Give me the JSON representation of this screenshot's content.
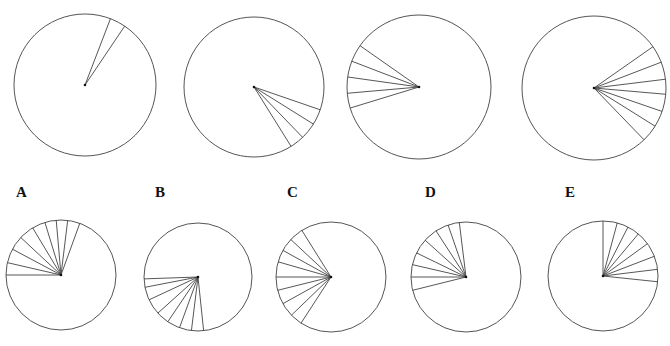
{
  "figure": {
    "stroke_color": "#555555",
    "top_row": [
      {
        "id": "top-1",
        "cx": 85,
        "cy": 85,
        "r": 71,
        "angles_deg_clockwise_from_top": [
          21,
          34
        ]
      },
      {
        "id": "top-2",
        "cx": 254,
        "cy": 87,
        "r": 70,
        "angles_deg_clockwise_from_top": [
          109,
          122,
          136,
          148
        ]
      },
      {
        "id": "top-3",
        "cx": 419,
        "cy": 87,
        "r": 72,
        "angles_deg_clockwise_from_top": [
          253,
          265,
          278,
          291,
          305
        ]
      },
      {
        "id": "top-4",
        "cx": 594,
        "cy": 88,
        "r": 72,
        "angles_deg_clockwise_from_top": [
          55,
          69,
          83,
          95,
          109,
          122,
          136
        ]
      }
    ],
    "options": [
      {
        "label": "A",
        "label_x": 16,
        "cx": 61,
        "cy": 275,
        "r": 55,
        "angles_deg_clockwise_from_top": [
          270,
          283,
          298,
          313,
          329,
          343,
          355,
          7,
          20
        ]
      },
      {
        "label": "B",
        "label_x": 155,
        "cx": 198,
        "cy": 277,
        "r": 54,
        "angles_deg_clockwise_from_top": [
          268,
          259,
          245,
          228,
          214,
          200,
          187,
          174
        ]
      },
      {
        "label": "C",
        "label_x": 287,
        "cx": 331,
        "cy": 277,
        "r": 55,
        "angles_deg_clockwise_from_top": [
          328,
          313,
          299,
          286,
          270,
          256,
          241,
          226,
          213
        ]
      },
      {
        "label": "D",
        "label_x": 425,
        "cx": 466,
        "cy": 277,
        "r": 55,
        "angles_deg_clockwise_from_top": [
          353,
          341,
          327,
          312,
          296,
          283,
          270,
          256
        ]
      },
      {
        "label": "E",
        "label_x": 565,
        "cx": 603,
        "cy": 276,
        "r": 55,
        "angles_deg_clockwise_from_top": [
          0,
          15,
          27,
          40,
          54,
          69,
          83,
          96
        ]
      }
    ],
    "label_top_y": 185
  }
}
